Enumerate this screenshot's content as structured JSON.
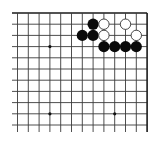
{
  "diagram": {
    "type": "go-board-fragment",
    "colors": {
      "background": "#ffffff",
      "line": "#3a3a3a",
      "border": "#1a1a1a",
      "black_stone": "#0a0a0a",
      "white_stone_fill": "#ffffff",
      "white_stone_stroke": "#333333",
      "star_point": "#111111"
    },
    "grid": {
      "origin_x": 17.5,
      "origin_y": 13,
      "col_spacing": 10.8,
      "row_spacing": 11.2,
      "columns": 13,
      "rows": 11,
      "left_extend_to": 12,
      "bottom_extend_to": 132,
      "top_edge": true,
      "right_edge": true
    },
    "star_points": [
      {
        "col": 3,
        "row": 3
      },
      {
        "col": 3,
        "row": 9
      },
      {
        "col": 9,
        "row": 9
      }
    ],
    "stones": [
      {
        "color": "black",
        "col": 7,
        "row": 1
      },
      {
        "color": "black",
        "col": 6,
        "row": 2
      },
      {
        "color": "black",
        "col": 7,
        "row": 2
      },
      {
        "color": "black",
        "col": 8,
        "row": 3
      },
      {
        "color": "black",
        "col": 9,
        "row": 3
      },
      {
        "color": "black",
        "col": 10,
        "row": 3
      },
      {
        "color": "black",
        "col": 11,
        "row": 3
      },
      {
        "color": "white",
        "col": 8,
        "row": 1
      },
      {
        "color": "white",
        "col": 10,
        "row": 1
      },
      {
        "color": "white",
        "col": 8,
        "row": 2
      },
      {
        "color": "white",
        "col": 11,
        "row": 2
      }
    ]
  }
}
